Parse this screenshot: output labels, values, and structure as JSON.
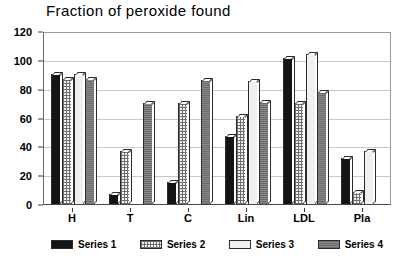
{
  "chart_data": {
    "type": "bar",
    "title": "Fraction of peroxide found",
    "xlabel": "",
    "ylabel": "",
    "ylim": [
      0,
      120
    ],
    "yticks": [
      0,
      20,
      40,
      60,
      80,
      100,
      120
    ],
    "grid": true,
    "legend_position": "bottom",
    "categories": [
      "H",
      "T",
      "C",
      "Lin",
      "LDL",
      "Pla"
    ],
    "series": [
      {
        "name": "Series 1",
        "color": "#141414",
        "values": [
          90,
          7,
          15,
          47,
          101,
          32
        ]
      },
      {
        "name": "Series 2",
        "color": "#f2f2f2",
        "values": [
          87,
          37,
          70,
          61,
          70,
          8
        ]
      },
      {
        "name": "Series 3",
        "color": "#f0f0f0",
        "values": [
          90,
          0,
          0,
          85,
          104,
          37
        ]
      },
      {
        "name": "Series 4",
        "color": "#8a8a8a",
        "values": [
          87,
          70,
          86,
          71,
          78,
          0
        ]
      }
    ]
  },
  "legend": {
    "items": [
      {
        "label": "Series 1"
      },
      {
        "label": "Series 2"
      },
      {
        "label": "Series 3"
      },
      {
        "label": "Series 4"
      }
    ]
  }
}
